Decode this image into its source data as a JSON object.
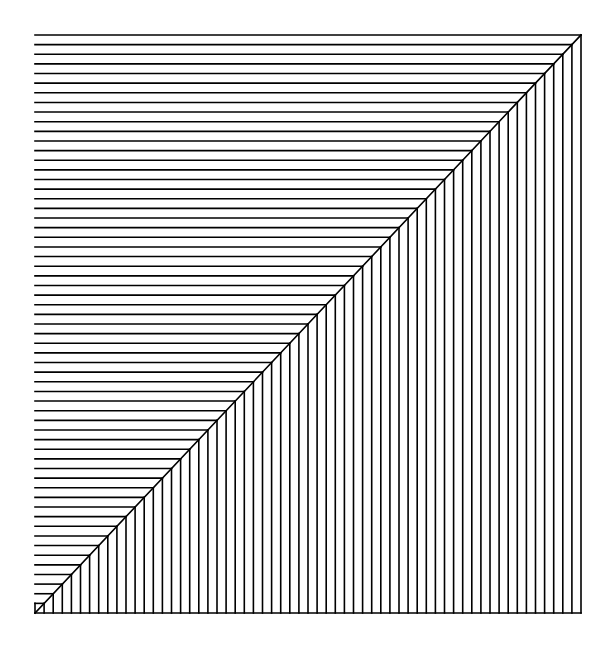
{
  "diagram": {
    "type": "line-pattern",
    "bounds": {
      "left": 35,
      "top": 35,
      "right": 581,
      "bottom": 613
    },
    "divisions": 60,
    "stroke_color": "#000000",
    "stroke_width": 1.6,
    "background": "#ffffff"
  }
}
